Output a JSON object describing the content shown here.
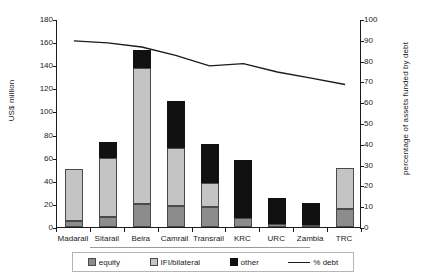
{
  "chart_data": {
    "type": "bar",
    "title": "",
    "subtitle": "",
    "xlabel": "",
    "ylabel": "US$ million",
    "ylabel_right": "percentage of assets funded by debt",
    "ylim": [
      0,
      180
    ],
    "ylim_right": [
      0,
      100
    ],
    "yticks": [
      0,
      20,
      40,
      60,
      80,
      100,
      120,
      140,
      160,
      180
    ],
    "yticks_right": [
      0,
      10,
      20,
      30,
      40,
      50,
      60,
      70,
      80,
      90,
      100
    ],
    "grid": false,
    "legend_position": "bottom",
    "stacked": true,
    "categories": [
      "Madarail",
      "Sitarail",
      "Beira",
      "Camrail",
      "Transrail",
      "KRC",
      "URC",
      "Zambia",
      "TRC"
    ],
    "series": [
      {
        "name": "equity",
        "color": "#8c8c8c",
        "values": [
          5,
          9,
          20,
          18,
          17,
          8,
          3,
          2,
          16
        ]
      },
      {
        "name": "IFI/bilateral",
        "color": "#c4c4c4",
        "values": [
          45,
          51,
          118,
          50,
          21,
          0,
          0,
          0,
          35
        ]
      },
      {
        "name": "other",
        "color": "#111111",
        "values": [
          0,
          14,
          15,
          41,
          34,
          50,
          22,
          19,
          0
        ]
      }
    ],
    "line_series": {
      "name": "% debt",
      "color": "#1a1a1a",
      "axis": "right",
      "values": [
        90,
        89,
        87,
        83,
        78,
        79,
        75,
        72,
        69
      ]
    },
    "stack_totals": [
      50,
      74,
      153,
      109,
      72,
      58,
      25,
      21,
      51
    ]
  },
  "axes": {
    "left_title": "US$ million",
    "right_title": "percentage of assets funded by debt",
    "left_ticks": [
      "0",
      "20",
      "40",
      "60",
      "80",
      "100",
      "120",
      "140",
      "160",
      "180"
    ],
    "right_ticks": [
      "0",
      "10",
      "20",
      "30",
      "40",
      "50",
      "60",
      "70",
      "80",
      "90",
      "100"
    ]
  },
  "legend": {
    "items": [
      {
        "label": "equity",
        "type": "swatch",
        "color": "#8c8c8c"
      },
      {
        "label": "IFI/bilateral",
        "type": "swatch",
        "color": "#c4c4c4"
      },
      {
        "label": "other",
        "type": "swatch",
        "color": "#111111"
      },
      {
        "label": "% debt",
        "type": "line",
        "color": "#1a1a1a"
      }
    ]
  }
}
